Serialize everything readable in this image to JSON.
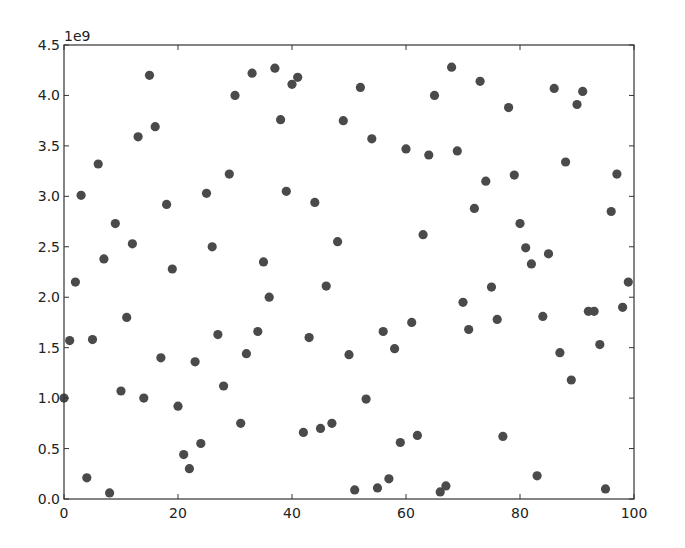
{
  "chart_data": {
    "type": "scatter",
    "title": "",
    "xlabel": "",
    "ylabel": "",
    "y_offset_label": "1e9",
    "xlim": [
      0,
      100
    ],
    "ylim": [
      0,
      4500000000.0
    ],
    "x_ticks": [
      0,
      20,
      40,
      60,
      80,
      100
    ],
    "x_tick_labels": [
      "0",
      "20",
      "40",
      "60",
      "80",
      "100"
    ],
    "y_ticks": [
      0,
      0.5,
      1.0,
      1.5,
      2.0,
      2.5,
      3.0,
      3.5,
      4.0,
      4.5
    ],
    "y_tick_labels": [
      "0.0",
      "0.5",
      "1.0",
      "1.5",
      "2.0",
      "2.5",
      "3.0",
      "3.5",
      "4.0",
      "4.5"
    ],
    "y_scale": 1000000000.0,
    "grid": false,
    "legend": null,
    "marker_color": "#4a4a4a",
    "x": [
      0,
      1,
      2,
      3,
      4,
      5,
      6,
      7,
      8,
      9,
      10,
      11,
      12,
      13,
      14,
      15,
      16,
      17,
      18,
      19,
      20,
      21,
      22,
      23,
      24,
      25,
      26,
      27,
      28,
      29,
      30,
      31,
      32,
      33,
      34,
      35,
      36,
      37,
      38,
      39,
      40,
      41,
      42,
      43,
      44,
      45,
      46,
      47,
      48,
      49,
      50,
      51,
      52,
      53,
      54,
      55,
      56,
      57,
      58,
      59,
      60,
      61,
      62,
      63,
      64,
      65,
      66,
      67,
      68,
      69,
      70,
      71,
      72,
      73,
      74,
      75,
      76,
      77,
      78,
      79,
      80,
      81,
      82,
      83,
      84,
      85,
      86,
      87,
      88,
      89,
      90,
      91,
      92,
      93,
      94,
      95,
      96,
      97,
      98,
      99
    ],
    "y": [
      1.0,
      1.57,
      2.15,
      3.01,
      0.21,
      1.58,
      3.32,
      2.38,
      0.06,
      2.73,
      1.07,
      1.8,
      2.53,
      3.59,
      1.0,
      4.2,
      3.69,
      1.4,
      2.92,
      2.28,
      0.92,
      0.44,
      0.3,
      1.36,
      0.55,
      3.03,
      2.5,
      1.63,
      1.12,
      3.22,
      4.0,
      0.75,
      1.44,
      4.22,
      1.66,
      2.35,
      2.0,
      4.27,
      3.76,
      3.05,
      4.11,
      4.18,
      0.66,
      1.6,
      2.94,
      0.7,
      2.11,
      0.75,
      2.55,
      3.75,
      1.43,
      0.09,
      4.08,
      0.99,
      3.57,
      0.11,
      1.66,
      0.2,
      1.49,
      0.56,
      3.47,
      1.75,
      0.63,
      2.62,
      3.41,
      4.0,
      0.07,
      0.13,
      4.28,
      3.45,
      1.95,
      1.68,
      2.88,
      4.14,
      3.15,
      2.1,
      1.78,
      0.62,
      3.88,
      3.21,
      2.73,
      2.49,
      2.33,
      0.23,
      1.81,
      2.43,
      4.07,
      1.45,
      3.34,
      1.18,
      3.91,
      4.04,
      1.86,
      1.86,
      1.53,
      0.1,
      2.85,
      3.22,
      1.9,
      2.15
    ]
  }
}
